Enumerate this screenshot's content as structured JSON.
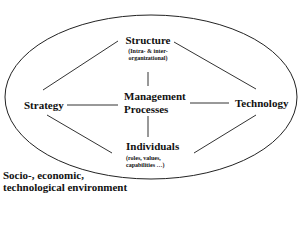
{
  "diagram": {
    "nodes": {
      "structure": {
        "title": "Structure",
        "subtitle_lines": [
          "(Intra- & inter-",
          "organizational)"
        ]
      },
      "strategy": {
        "title": "Strategy"
      },
      "management": {
        "title_lines": [
          "Management",
          "Processes"
        ]
      },
      "technology": {
        "title": "Technology"
      },
      "individuals": {
        "title": "Individuals",
        "subtitle_lines": [
          "(roles, values,",
          "capabilities …)"
        ]
      }
    },
    "environment": {
      "lines": [
        "Socio-, economic,",
        "technological environment"
      ]
    },
    "connections": [
      [
        "structure",
        "strategy"
      ],
      [
        "structure",
        "technology"
      ],
      [
        "structure",
        "management"
      ],
      [
        "strategy",
        "management"
      ],
      [
        "management",
        "technology"
      ],
      [
        "management",
        "individuals"
      ],
      [
        "strategy",
        "individuals"
      ],
      [
        "technology",
        "individuals"
      ]
    ]
  }
}
